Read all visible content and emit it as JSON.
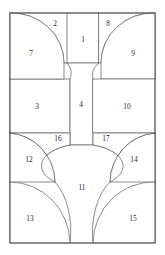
{
  "diagram": {
    "canvas": {
      "width": 165,
      "height": 255
    },
    "frame": {
      "x": 10,
      "y": 13,
      "width": 145,
      "height": 230
    },
    "colors": {
      "background": "#ffffff",
      "stroke": "#5a5a5a",
      "frame_stroke": "#4a4a4a",
      "label": "#2b2b2b"
    },
    "region_count": 17,
    "regions": [
      {
        "id": 1,
        "label": "1",
        "label_x": 83,
        "label_y": 40,
        "path": "M 67 13 L 99 13 L 99 63 L 67 63 Z"
      },
      {
        "id": 2,
        "label": "2",
        "label_x": 55,
        "label_y": 24,
        "path": "M 10 13 L 67 13 L 67 63 L 64 63 A 52 50 0 0 0 10 13 Z"
      },
      {
        "id": 3,
        "label": "3",
        "label_x": 37,
        "label_y": 107,
        "path": "M 10 79 L 70 79 L 70 133 L 10 133 Z"
      },
      {
        "id": 4,
        "label": "4",
        "label_x": 81,
        "label_y": 105,
        "path": "M 67 63 L 99 63 A 18 16 0 0 0 93 79 L 93 145 L 70 145 L 70 79 A 18 16 0 0 0 67 63 Z"
      },
      {
        "id": 7,
        "label": "7",
        "label_x": 31,
        "label_y": 54,
        "path": "M 10 13 A 52 50 0 0 1 64 63 L 64 79 L 10 79 Z"
      },
      {
        "id": 8,
        "label": "8",
        "label_x": 108,
        "label_y": 24,
        "path": "M 99 13 L 155 13 A 52 50 0 0 0 101 63 L 99 63 Z"
      },
      {
        "id": 9,
        "label": "9",
        "label_x": 133,
        "label_y": 54,
        "path": "M 155 13 A 52 50 0 0 0 101 63 L 101 79 L 155 79 Z"
      },
      {
        "id": 10,
        "label": "10",
        "label_x": 127,
        "label_y": 107,
        "path": "M 93 79 L 155 79 L 155 133 L 93 133 Z"
      },
      {
        "id": 11,
        "label": "11",
        "label_x": 82,
        "label_y": 188,
        "path": "M 70 145 L 93 145 A 42 22 0 0 1 110 182 A 34 58 0 0 0 93 243 L 70 243 A 34 58 0 0 0 55 182 A 42 22 0 0 1 70 145 Z"
      },
      {
        "id": 12,
        "label": "12",
        "label_x": 29,
        "label_y": 160,
        "path": "M 10 133 A 48 50 0 0 1 55 182 L 10 182 Z"
      },
      {
        "id": 13,
        "label": "13",
        "label_x": 30,
        "label_y": 219,
        "path": "M 10 182 A 60 62 0 0 1 70 243 L 10 243 Z"
      },
      {
        "id": 14,
        "label": "14",
        "label_x": 134,
        "label_y": 160,
        "path": "M 155 133 A 48 50 0 0 0 110 182 L 155 182 Z"
      },
      {
        "id": 15,
        "label": "15",
        "label_x": 133,
        "label_y": 219,
        "path": "M 155 182 A 60 62 0 0 0 93 243 L 155 243 Z"
      },
      {
        "id": 16,
        "label": "16",
        "label_x": 58,
        "label_y": 139,
        "path": "M 10 133 L 70 133 L 70 145 A 42 22 0 0 0 55 182 A 48 50 0 0 0 10 133 Z"
      },
      {
        "id": 17,
        "label": "17",
        "label_x": 106,
        "label_y": 139,
        "path": "M 155 133 L 93 133 L 93 145 A 42 22 0 0 1 110 182 A 48 50 0 0 1 155 133 Z"
      }
    ]
  }
}
